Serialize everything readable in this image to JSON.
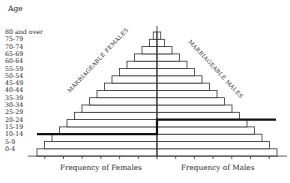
{
  "chart_data": {
    "type": "bar",
    "subtype": "population-pyramid",
    "title": "",
    "ylabel": "Age",
    "categories": [
      "0-4",
      "5-9",
      "10-14",
      "15-19",
      "20-24",
      "25-29",
      "30-34",
      "35-39",
      "40-44",
      "45-49",
      "50-54",
      "55-59",
      "60-64",
      "65-69",
      "70-74",
      "75-79",
      "80 and over"
    ],
    "series": [
      {
        "name": "Females",
        "values": [
          16,
          15,
          14,
          13,
          12,
          11,
          10,
          9,
          8,
          7,
          6,
          5,
          4,
          3,
          2,
          1,
          0.5
        ]
      },
      {
        "name": "Males",
        "values": [
          16,
          15,
          14,
          13,
          12,
          11,
          10,
          9,
          8,
          7,
          6,
          5,
          4,
          3,
          2,
          1,
          0.5
        ]
      }
    ],
    "xlabel_left": "Frequency of Females",
    "xlabel_right": "Frequency of Males",
    "annotations": [
      {
        "text": "MARRIAGEABLE FEMALES",
        "side": "left",
        "threshold_age_group": "15-19"
      },
      {
        "text": "MARRIAGEABLE MALES",
        "side": "right",
        "threshold_age_group": "25-29"
      }
    ],
    "grid": false,
    "legend": "none",
    "x_ticks_per_side": 6
  },
  "labels": {
    "age_title": "Age",
    "ages_top_to_bottom": [
      "80 and over",
      "75-79",
      "70-74",
      "65-69",
      "60-64",
      "55-59",
      "50-54",
      "45-49",
      "40-44",
      "35-39",
      "30-34",
      "25-29",
      "20-24",
      "15-19",
      "10-14",
      "5-9",
      "0-4"
    ],
    "freq_females": "Frequency of Females",
    "freq_males": "Frequency of Males",
    "ann_females": "MARRIAGEABLE FEMALES",
    "ann_males": "MARRIAGEABLE MALES",
    "caption": "FIGURE 1"
  },
  "colors": {
    "line": "#333333",
    "threshold": "#111111"
  }
}
